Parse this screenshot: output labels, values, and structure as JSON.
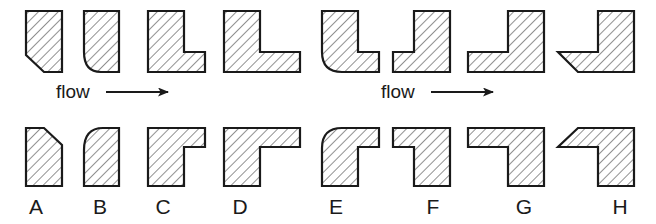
{
  "figure": {
    "background_color": "#ffffff",
    "outline_color": "#1a1a1a",
    "hatch_color": "#3a3a3a",
    "hatch_angle_deg": 45,
    "rows": 2,
    "columns": 8
  },
  "flow": {
    "left_label": "flow",
    "right_label": "flow",
    "arrow_glyph": "arrow-right",
    "direction": "left-to-right"
  },
  "labels": {
    "items": [
      {
        "id": "A",
        "text": "A"
      },
      {
        "id": "B",
        "text": "B"
      },
      {
        "id": "C",
        "text": "C"
      },
      {
        "id": "D",
        "text": "D"
      },
      {
        "id": "E",
        "text": "E"
      },
      {
        "id": "F",
        "text": "F"
      },
      {
        "id": "G",
        "text": "G"
      },
      {
        "id": "H",
        "text": "H"
      }
    ]
  },
  "top_shapes": [
    {
      "id": "top-1",
      "name": "chamfered-bar",
      "feature": "straight chamfer at bottom-left"
    },
    {
      "id": "top-2",
      "name": "filleted-bar",
      "feature": "concave radius at bottom-left"
    },
    {
      "id": "top-3",
      "name": "square-L-short",
      "feature": "sharp inner corner, short foot"
    },
    {
      "id": "top-4",
      "name": "square-L-long",
      "feature": "sharp inner corner, long foot"
    },
    {
      "id": "top-5",
      "name": "radiused-L",
      "feature": "rounded outer corner"
    },
    {
      "id": "top-6",
      "name": "square-J-short",
      "feature": "mirrored L, short foot"
    },
    {
      "id": "top-7",
      "name": "square-J-long",
      "feature": "mirrored L, long foot"
    },
    {
      "id": "top-8",
      "name": "chamfered-J",
      "feature": "mirrored L with chamfered foot"
    }
  ],
  "bottom_shapes": [
    {
      "id": "A",
      "name": "chamfered-bar-flipped",
      "feature": "straight chamfer at top-right"
    },
    {
      "id": "B",
      "name": "filleted-bar-flipped",
      "feature": "convex radius at top-left"
    },
    {
      "id": "C",
      "name": "square-L-short-flipped",
      "feature": "sharp corner, short top arm"
    },
    {
      "id": "D",
      "name": "square-L-long-flipped",
      "feature": "sharp corner, long top arm"
    },
    {
      "id": "E",
      "name": "radiused-L-flipped",
      "feature": "rounded outer corner at top-left"
    },
    {
      "id": "F",
      "name": "square-J-short-flipped",
      "feature": "mirrored, short top arm"
    },
    {
      "id": "G",
      "name": "square-J-long-flipped",
      "feature": "mirrored, long top arm"
    },
    {
      "id": "H",
      "name": "chamfered-J-flipped",
      "feature": "mirrored with chamfered top arm"
    }
  ]
}
